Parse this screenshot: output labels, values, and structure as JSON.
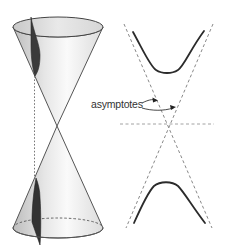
{
  "figure": {
    "labels": {
      "asymptotes": "asymptotes"
    },
    "colors": {
      "outline": "#555555",
      "cone_light": "#f2f2f2",
      "cone_shade": "#c9c9c9",
      "section_dark": "#3a3a3a",
      "curve": "#2b2b2b",
      "dashed": "#7a7a7a"
    }
  }
}
